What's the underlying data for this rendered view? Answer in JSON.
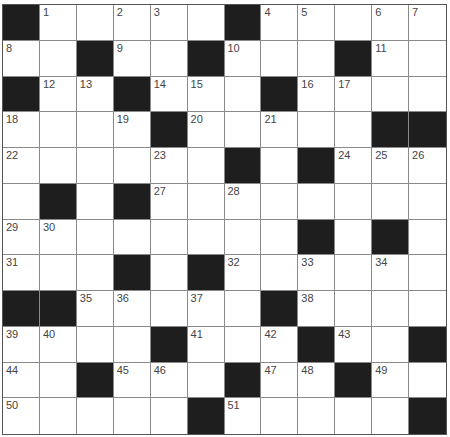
{
  "puzzle": {
    "rows": 12,
    "cols": 12,
    "colors": {
      "black_cell": "#1e1e1e",
      "white_cell": "#ffffff",
      "grid_line": "#8a8a8a",
      "number": "#444444"
    },
    "grid": [
      [
        "B",
        1,
        0,
        2,
        3,
        0,
        "B",
        4,
        5,
        0,
        6,
        7
      ],
      [
        8,
        0,
        "B",
        9,
        0,
        "B",
        10,
        0,
        0,
        "B",
        11,
        0
      ],
      [
        "B",
        12,
        13,
        "B",
        14,
        15,
        0,
        "B",
        16,
        17,
        0,
        0
      ],
      [
        18,
        0,
        0,
        19,
        "B",
        20,
        0,
        21,
        0,
        0,
        "B",
        "B"
      ],
      [
        22,
        0,
        0,
        0,
        23,
        0,
        "B",
        0,
        "B",
        24,
        25,
        26
      ],
      [
        0,
        "B",
        0,
        "B",
        27,
        0,
        28,
        0,
        0,
        0,
        0,
        0
      ],
      [
        29,
        30,
        0,
        0,
        0,
        0,
        0,
        0,
        "B",
        0,
        "B",
        0
      ],
      [
        31,
        0,
        0,
        "B",
        0,
        "B",
        32,
        0,
        33,
        0,
        34,
        0
      ],
      [
        "B",
        "B",
        35,
        36,
        0,
        37,
        0,
        "B",
        38,
        0,
        0,
        0
      ],
      [
        39,
        40,
        0,
        0,
        "B",
        41,
        0,
        42,
        "B",
        43,
        0,
        "B"
      ],
      [
        44,
        0,
        "B",
        45,
        46,
        0,
        "B",
        47,
        48,
        "B",
        49,
        0
      ],
      [
        50,
        0,
        0,
        0,
        0,
        "B",
        51,
        0,
        0,
        0,
        0,
        "B"
      ]
    ]
  }
}
